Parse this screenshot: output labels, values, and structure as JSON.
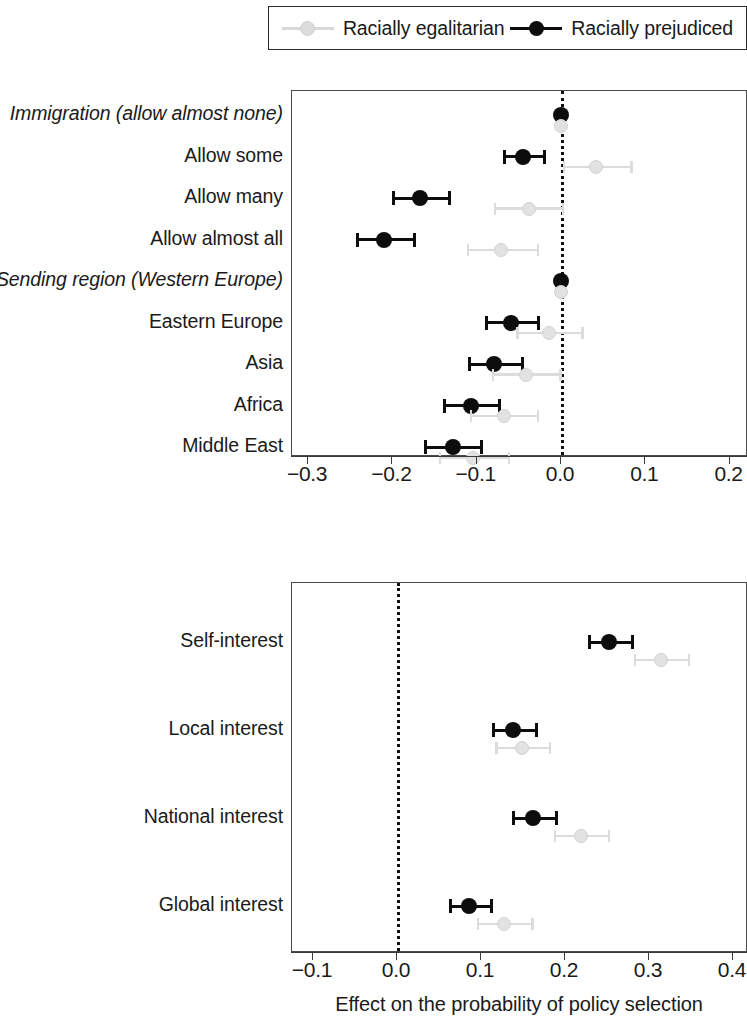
{
  "legend": {
    "entries": [
      {
        "label": "Racially egalitarian",
        "color": "#dcdcdc",
        "marker": "light-dot-with-line"
      },
      {
        "label": "Racially prejudiced",
        "color": "#0d0d0d",
        "marker": "dark-dot-with-line"
      }
    ]
  },
  "axis_title": "Effect on the probability of policy selection",
  "chart_data": [
    {
      "type": "scatter",
      "plot_name": "upper-panel",
      "title": "",
      "xlabel": "",
      "ylabel": "",
      "xlim": [
        -0.35,
        0.24
      ],
      "grid": false,
      "reference_line": 0.0,
      "legend_position": "top",
      "xticks": [
        -0.3,
        -0.2,
        -0.1,
        0.0,
        0.1,
        0.2
      ],
      "xticklabels": [
        "−0.3",
        "−0.2",
        "−0.1",
        "0.0",
        "0.1",
        "0.2"
      ],
      "categories": [
        "Immigration (allow almost none)",
        "Allow some",
        "Allow many",
        "Allow almost all",
        "Sending region (Western Europe)",
        "Eastern Europe",
        "Asia",
        "Africa",
        "Middle East"
      ],
      "category_styles": [
        "italic",
        "normal",
        "normal",
        "normal",
        "italic",
        "normal",
        "normal",
        "normal",
        "normal"
      ],
      "series": [
        {
          "name": "Racially prejudiced",
          "color": "#0d0d0d",
          "points": [
            {
              "category": "Immigration (allow almost none)",
              "estimate": 0.0,
              "ci_low": 0.0,
              "ci_high": 0.0
            },
            {
              "category": "Allow some",
              "estimate": -0.045,
              "ci_low": -0.069,
              "ci_high": -0.021
            },
            {
              "category": "Allow many",
              "estimate": -0.167,
              "ci_low": -0.2,
              "ci_high": -0.134
            },
            {
              "category": "Allow almost all",
              "estimate": -0.21,
              "ci_low": -0.243,
              "ci_high": -0.176
            },
            {
              "category": "Sending region (Western Europe)",
              "estimate": 0.0,
              "ci_low": 0.0,
              "ci_high": 0.0
            },
            {
              "category": "Eastern Europe",
              "estimate": -0.059,
              "ci_low": -0.09,
              "ci_high": -0.029
            },
            {
              "category": "Asia",
              "estimate": -0.079,
              "ci_low": -0.11,
              "ci_high": -0.048
            },
            {
              "category": "Africa",
              "estimate": -0.107,
              "ci_low": -0.14,
              "ci_high": -0.075
            },
            {
              "category": "Middle East",
              "estimate": -0.128,
              "ci_low": -0.162,
              "ci_high": -0.096
            }
          ]
        },
        {
          "name": "Racially egalitarian",
          "color": "#dcdcdc",
          "points": [
            {
              "category": "Immigration (allow almost none)",
              "estimate": 0.0,
              "ci_low": 0.0,
              "ci_high": 0.0
            },
            {
              "category": "Allow some",
              "estimate": 0.042,
              "ci_low": 0.002,
              "ci_high": 0.082
            },
            {
              "category": "Allow many",
              "estimate": -0.038,
              "ci_low": -0.08,
              "ci_high": 0.001
            },
            {
              "category": "Allow almost all",
              "estimate": -0.071,
              "ci_low": -0.112,
              "ci_high": -0.029
            },
            {
              "category": "Sending region (Western Europe)",
              "estimate": 0.0,
              "ci_low": 0.0,
              "ci_high": 0.0
            },
            {
              "category": "Eastern Europe",
              "estimate": -0.014,
              "ci_low": -0.053,
              "ci_high": 0.024
            },
            {
              "category": "Asia",
              "estimate": -0.042,
              "ci_low": -0.082,
              "ci_high": -0.002
            },
            {
              "category": "Africa",
              "estimate": -0.068,
              "ci_low": -0.108,
              "ci_high": -0.029
            },
            {
              "category": "Middle East",
              "estimate": -0.104,
              "ci_low": -0.145,
              "ci_high": -0.063
            }
          ]
        }
      ]
    },
    {
      "type": "scatter",
      "plot_name": "lower-panel",
      "title": "",
      "xlabel": "Effect on the probability of policy selection",
      "ylabel": "",
      "xlim": [
        -0.135,
        0.42
      ],
      "grid": false,
      "reference_line": 0.0,
      "legend_position": "top",
      "xticks": [
        -0.1,
        0.0,
        0.1,
        0.2,
        0.3,
        0.4
      ],
      "xticklabels": [
        "−0.1",
        "0.0",
        "0.1",
        "0.2",
        "0.3",
        "0.4"
      ],
      "categories": [
        "Self-interest",
        "Local interest",
        "National interest",
        "Global interest"
      ],
      "category_styles": [
        "normal",
        "normal",
        "normal",
        "normal"
      ],
      "series": [
        {
          "name": "Racially prejudiced",
          "color": "#0d0d0d",
          "points": [
            {
              "category": "Self-interest",
              "estimate": 0.252,
              "ci_low": 0.227,
              "ci_high": 0.278
            },
            {
              "category": "Local interest",
              "estimate": 0.138,
              "ci_low": 0.113,
              "ci_high": 0.164
            },
            {
              "category": "National interest",
              "estimate": 0.162,
              "ci_low": 0.137,
              "ci_high": 0.188
            },
            {
              "category": "Global interest",
              "estimate": 0.086,
              "ci_low": 0.062,
              "ci_high": 0.111
            }
          ]
        },
        {
          "name": "Racially egalitarian",
          "color": "#dcdcdc",
          "points": [
            {
              "category": "Self-interest",
              "estimate": 0.314,
              "ci_low": 0.282,
              "ci_high": 0.346
            },
            {
              "category": "Local interest",
              "estimate": 0.149,
              "ci_low": 0.117,
              "ci_high": 0.181
            },
            {
              "category": "National interest",
              "estimate": 0.219,
              "ci_low": 0.187,
              "ci_high": 0.251
            },
            {
              "category": "Global interest",
              "estimate": 0.127,
              "ci_low": 0.095,
              "ci_high": 0.16
            }
          ]
        }
      ]
    }
  ]
}
